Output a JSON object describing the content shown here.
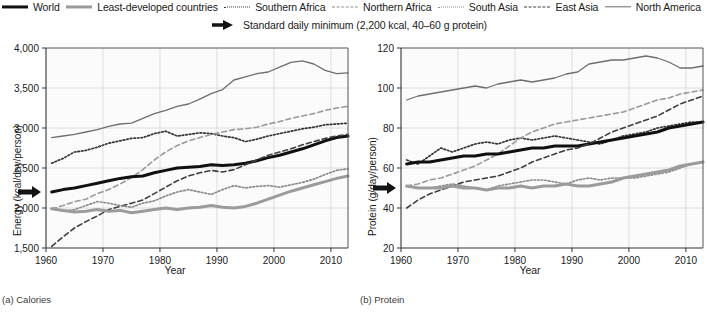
{
  "legend": {
    "row1": [
      {
        "label": "World",
        "style": "solid-bold",
        "color": "#101010"
      },
      {
        "label": "Least-developed countries",
        "style": "solid-grey",
        "color": "#9b9b9b"
      },
      {
        "label": "Southern Africa",
        "style": "dotted",
        "color": "#3a3a3a"
      },
      {
        "label": "Northern Africa",
        "style": "dashed",
        "color": "#8e8e8e"
      },
      {
        "label": "South Asia",
        "style": "dotted-lt",
        "color": "#8c8c8c"
      },
      {
        "label": "East Asia",
        "style": "dashed-dk",
        "color": "#3f3f3f"
      },
      {
        "label": "North America",
        "style": "solid-thin",
        "color": "#6e6e6e"
      }
    ],
    "row2": {
      "icon": "right-arrow-icon",
      "label": "Standard daily minimum (2,200 kcal, 40–60 g protein)"
    }
  },
  "panels": [
    {
      "caption": "(a) Calories"
    },
    {
      "caption": "(b) Protein"
    }
  ],
  "chart_data": [
    {
      "type": "line",
      "title": "(a) Calories",
      "xlabel": "Year",
      "ylabel": "Energy (kcal/day/person)",
      "xlim": [
        1960,
        2013
      ],
      "ylim": [
        1500,
        4000
      ],
      "xticks": [
        1960,
        1970,
        1980,
        1990,
        2000,
        2010
      ],
      "yticks": [
        1500,
        2000,
        2500,
        3000,
        3500,
        4000
      ],
      "ytick_labels": [
        "1,500",
        "2,000",
        "2,500",
        "3,000",
        "3,500",
        "4,000"
      ],
      "grid": true,
      "legend_position": "above-figure",
      "annotations": [
        {
          "name": "standard-daily-minimum",
          "value": 2200,
          "label": "Standard daily minimum (2,200 kcal)"
        }
      ],
      "x": [
        1961,
        1963,
        1965,
        1967,
        1969,
        1971,
        1973,
        1975,
        1977,
        1979,
        1981,
        1983,
        1985,
        1987,
        1989,
        1991,
        1993,
        1995,
        1997,
        1999,
        2001,
        2003,
        2005,
        2007,
        2009,
        2011,
        2013
      ],
      "series": [
        {
          "name": "North America",
          "style": "solid-thin",
          "values": [
            2880,
            2900,
            2920,
            2950,
            2980,
            3020,
            3050,
            3060,
            3120,
            3180,
            3220,
            3270,
            3300,
            3360,
            3430,
            3480,
            3600,
            3640,
            3680,
            3700,
            3760,
            3820,
            3840,
            3800,
            3720,
            3680,
            3690
          ]
        },
        {
          "name": "Southern Africa",
          "style": "dotted",
          "values": [
            2560,
            2620,
            2700,
            2720,
            2760,
            2810,
            2840,
            2870,
            2880,
            2930,
            2960,
            2900,
            2920,
            2940,
            2930,
            2900,
            2880,
            2830,
            2860,
            2900,
            2930,
            2960,
            2990,
            3010,
            3040,
            3050,
            3060
          ]
        },
        {
          "name": "Northern Africa",
          "style": "dashed",
          "values": [
            1990,
            2030,
            2080,
            2110,
            2180,
            2230,
            2300,
            2380,
            2480,
            2600,
            2700,
            2780,
            2840,
            2880,
            2920,
            2950,
            2980,
            2990,
            3010,
            3050,
            3080,
            3120,
            3150,
            3180,
            3220,
            3250,
            3270
          ]
        },
        {
          "name": "World",
          "style": "solid-bold",
          "values": [
            2200,
            2230,
            2250,
            2280,
            2310,
            2340,
            2370,
            2390,
            2400,
            2440,
            2470,
            2500,
            2510,
            2520,
            2540,
            2530,
            2540,
            2560,
            2590,
            2630,
            2660,
            2700,
            2740,
            2790,
            2840,
            2880,
            2900
          ]
        },
        {
          "name": "East Asia",
          "style": "dashed-dk",
          "values": [
            1520,
            1640,
            1750,
            1830,
            1900,
            1980,
            2020,
            2060,
            2100,
            2180,
            2260,
            2340,
            2400,
            2440,
            2470,
            2450,
            2480,
            2540,
            2600,
            2660,
            2700,
            2740,
            2790,
            2830,
            2870,
            2900,
            2920
          ]
        },
        {
          "name": "South Asia",
          "style": "dotted-lt",
          "values": [
            1990,
            1960,
            1980,
            2030,
            2080,
            2060,
            2030,
            2010,
            2060,
            2090,
            2150,
            2200,
            2230,
            2200,
            2170,
            2230,
            2280,
            2250,
            2270,
            2280,
            2260,
            2290,
            2320,
            2360,
            2420,
            2470,
            2490
          ]
        },
        {
          "name": "Least-developed countries",
          "style": "solid-grey",
          "values": [
            1990,
            1970,
            1950,
            1960,
            1980,
            1960,
            1970,
            1940,
            1960,
            1980,
            2000,
            1980,
            2000,
            2010,
            2030,
            2010,
            2000,
            2020,
            2060,
            2110,
            2160,
            2210,
            2250,
            2290,
            2330,
            2370,
            2400
          ]
        }
      ]
    },
    {
      "type": "line",
      "title": "(b) Protein",
      "xlabel": "Year",
      "ylabel": "Protein (g/day/person)",
      "xlim": [
        1960,
        2013
      ],
      "ylim": [
        20,
        120
      ],
      "xticks": [
        1960,
        1970,
        1980,
        1990,
        2000,
        2010
      ],
      "yticks": [
        20,
        40,
        60,
        80,
        100,
        120
      ],
      "ytick_labels": [
        "20",
        "40",
        "60",
        "80",
        "100",
        "120"
      ],
      "grid": true,
      "legend_position": "above-figure",
      "annotations": [
        {
          "name": "standard-daily-minimum",
          "value": 50,
          "label": "Standard daily minimum (40–60 g protein)"
        }
      ],
      "x": [
        1961,
        1963,
        1965,
        1967,
        1969,
        1971,
        1973,
        1975,
        1977,
        1979,
        1981,
        1983,
        1985,
        1987,
        1989,
        1991,
        1993,
        1995,
        1997,
        1999,
        2001,
        2003,
        2005,
        2007,
        2009,
        2011,
        2013
      ],
      "series": [
        {
          "name": "North America",
          "style": "solid-thin",
          "values": [
            94,
            96,
            97,
            98,
            99,
            100,
            101,
            100,
            102,
            103,
            104,
            103,
            104,
            105,
            107,
            108,
            112,
            113,
            114,
            114,
            115,
            116,
            115,
            113,
            110,
            110,
            111
          ]
        },
        {
          "name": "Southern Africa",
          "style": "dotted",
          "values": [
            64,
            62,
            66,
            70,
            68,
            70,
            72,
            73,
            72,
            74,
            75,
            74,
            75,
            76,
            75,
            74,
            73,
            72,
            74,
            76,
            77,
            78,
            80,
            81,
            82,
            83,
            83
          ]
        },
        {
          "name": "Northern Africa",
          "style": "dashed",
          "values": [
            51,
            52,
            54,
            55,
            57,
            59,
            61,
            64,
            67,
            71,
            75,
            78,
            80,
            82,
            83,
            84,
            85,
            86,
            87,
            88,
            90,
            92,
            94,
            95,
            97,
            98,
            99
          ]
        },
        {
          "name": "World",
          "style": "solid-bold",
          "values": [
            62,
            63,
            63,
            64,
            65,
            66,
            66,
            67,
            67,
            68,
            69,
            70,
            70,
            71,
            71,
            71,
            72,
            73,
            74,
            75,
            76,
            77,
            78,
            80,
            81,
            82,
            83
          ]
        },
        {
          "name": "East Asia",
          "style": "dashed-dk",
          "values": [
            40,
            44,
            47,
            49,
            51,
            53,
            54,
            55,
            56,
            58,
            60,
            63,
            65,
            67,
            69,
            70,
            72,
            75,
            78,
            80,
            82,
            84,
            86,
            89,
            92,
            94,
            96
          ]
        },
        {
          "name": "South Asia",
          "style": "dotted-lt",
          "values": [
            51,
            50,
            50,
            51,
            52,
            51,
            50,
            49,
            51,
            52,
            53,
            54,
            54,
            53,
            52,
            54,
            55,
            54,
            55,
            55,
            55,
            56,
            57,
            58,
            60,
            62,
            63
          ]
        },
        {
          "name": "Least-developed countries",
          "style": "solid-grey",
          "values": [
            51,
            50,
            50,
            50,
            51,
            50,
            50,
            49,
            50,
            50,
            51,
            50,
            51,
            51,
            52,
            51,
            51,
            52,
            53,
            55,
            56,
            57,
            58,
            59,
            61,
            62,
            63
          ]
        }
      ]
    }
  ]
}
